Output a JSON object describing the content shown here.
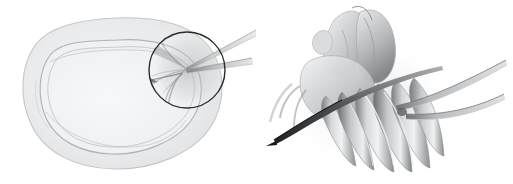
{
  "figure": {
    "kind": "medical-illustration",
    "title": "",
    "caption": "",
    "background_color": "#ffffff",
    "width": 513,
    "height": 184,
    "panel_count": 2,
    "has_text_labels": false
  },
  "palette": {
    "background": "#ffffff",
    "outline_faint": "#c9cbcd",
    "outline_light": "#b4b7b9",
    "tissue_fill_outer": "#e4e5e7",
    "tissue_fill_inner": "#eef0f1",
    "callout_circle_stroke": "#2b2b2b",
    "shading_mid": "#9a9d9f",
    "shading_dark": "#6e7173",
    "shading_darkest": "#3d3f41",
    "instrument_light": "#d6d8da",
    "instrument_mid": "#9fa2a4",
    "instrument_dark": "#2e3032"
  },
  "panels": [
    {
      "id": "overview",
      "name": "overview-panel",
      "description": "Oval organ cross-section in pale grey with a circular magnifier callout at its right margin and two slender instrument shafts entering from the upper right.",
      "organ": {
        "name": "organ-outline",
        "shape": "rounded-oval",
        "outer_band": true,
        "inner_contour": true,
        "fill": "#e6e7e9",
        "stroke": "#bcbfc1"
      },
      "callout": {
        "name": "callout-circle",
        "shape": "circle",
        "center_x": 187,
        "center_y": 70,
        "radius": 38,
        "stroke": "#2b2b2b",
        "stroke_width": 1.4,
        "fill": "none"
      },
      "instruments": [
        {
          "name": "instrument-shaft-upper",
          "tip_x": 172,
          "tip_y": 66,
          "end_x": 256,
          "end_y": 34
        },
        {
          "name": "instrument-shaft-lower",
          "tip_x": 172,
          "tip_y": 70,
          "end_x": 252,
          "end_y": 62
        }
      ]
    },
    {
      "id": "detail",
      "name": "detail-panel",
      "description": "Magnified soft-shaded anatomical detail: layered tissue folds at the upper left, a fan of elongated fibrous bundles sweeping down and right, a dark needle tip entering from the lower left, and two long curved instrument shafts exiting to the right.",
      "structures": [
        {
          "name": "tissue-fold-upper",
          "tone": "#b9bcbe"
        },
        {
          "name": "tissue-fold-crest",
          "tone": "#a7aaac"
        },
        {
          "name": "fiber-bundle-group",
          "tone": "#8f9294",
          "count": 6
        },
        {
          "name": "fiber-bundle-highlight",
          "tone": "#e8eaeb"
        }
      ],
      "instruments": [
        {
          "name": "needle-tip-lower-left",
          "tip_x": 330,
          "tip_y": 139,
          "end_x": 440,
          "end_y": 92,
          "tone": "#2e3032"
        },
        {
          "name": "curved-shaft-upper",
          "start_x": 398,
          "start_y": 106,
          "end_x": 505,
          "end_y": 63,
          "tone": "#9fa2a4"
        },
        {
          "name": "curved-shaft-lower",
          "start_x": 414,
          "start_y": 110,
          "end_x": 500,
          "end_y": 96,
          "tone": "#9fa2a4"
        }
      ]
    }
  ]
}
